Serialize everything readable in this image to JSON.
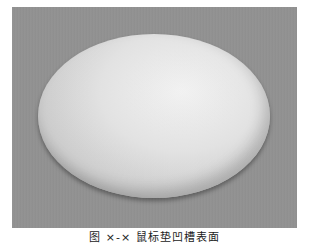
{
  "figure": {
    "image_description": "Grayscale photo of a white rounded capsule/oval shaped surface on a gray textured background",
    "caption": "图 ×-× 鼠标垫凹槽表面"
  },
  "colors": {
    "background": "#919191",
    "shape_highlight": "#f6f6f6",
    "shape_edge": "#8a8a8a"
  }
}
